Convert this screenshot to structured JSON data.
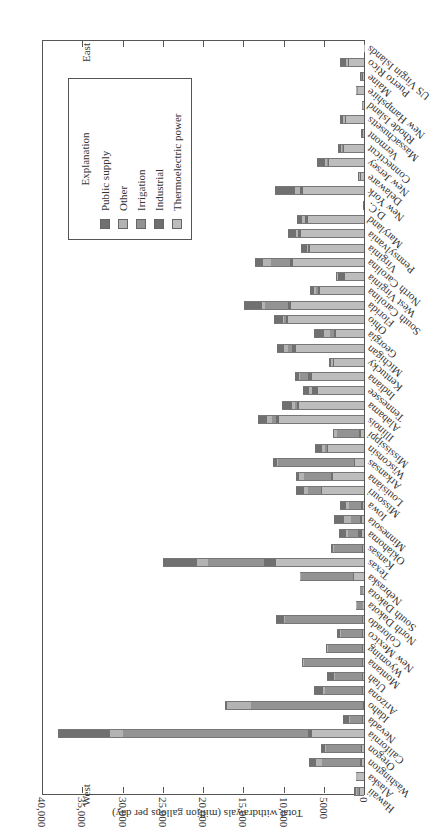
{
  "chart_data": {
    "type": "bar",
    "orientation": "rotated-90 (horizontal stacked bars extending left from axis; page rotated)",
    "stacked": true,
    "xlabel": "",
    "ylabel": "Total withdrawals (million gallons per day)",
    "ylim": [
      0,
      40000
    ],
    "yticks": [
      0,
      5000,
      10000,
      15000,
      20000,
      25000,
      30000,
      35000,
      40000
    ],
    "ytick_labels": [
      "0",
      "5000",
      "10,000",
      "15,000",
      "20,000",
      "25,000",
      "30,000",
      "35,000",
      "40,000"
    ],
    "grid": false,
    "annotations": {
      "west": "West",
      "east": "East"
    },
    "legend": {
      "title": "Explanation",
      "position": "upper-left inside plot (rotated)",
      "entries": [
        "Public supply",
        "Other",
        "Irrigation",
        "Industrial",
        "Thermoelectric power"
      ]
    },
    "series_colors": {
      "Thermoelectric power": "#bdbdbd",
      "Industrial": "#6f6f6f",
      "Irrigation": "#939393",
      "Other": "#b3b3b3",
      "Public supply": "#707070"
    },
    "stack_order": [
      "Thermoelectric power",
      "Industrial",
      "Irrigation",
      "Other",
      "Public supply"
    ],
    "categories": [
      "Hawaii",
      "Alaska",
      "Washington",
      "Oregon",
      "California",
      "Nevada",
      "Idaho",
      "Arizona",
      "Utah",
      "Montana",
      "Wyoming",
      "New Mexico",
      "Colorado",
      "North Dakota",
      "South Dakota",
      "Nebraska",
      "Texas",
      "Kansas",
      "Oklahoma",
      "Minnesota",
      "Iowa",
      "Missouri",
      "Louisiana",
      "Arkansas",
      "Wisconsin",
      "Mississippi",
      "Illinois",
      "Alabama",
      "Tennessee",
      "Indiana",
      "Kentucky",
      "Michigan",
      "Georgia",
      "Ohio",
      "Florida",
      "South Carolina",
      "West Virginia",
      "North Carolina",
      "Virginia",
      "Pennsylvania",
      "Maryland",
      "D.C.",
      "New York",
      "Delaware",
      "New Jersey",
      "Connecticut",
      "Vermont",
      "Massachusetts",
      "Rhode Island",
      "New Hampshire",
      "Maine",
      "Puerto Rico",
      "US Virgin Islands"
    ],
    "series": [
      {
        "name": "Thermoelectric power",
        "values": [
          500,
          700,
          200,
          300,
          6400,
          100,
          0,
          100,
          100,
          100,
          100,
          100,
          100,
          100,
          100,
          1300,
          10900,
          100,
          300,
          200,
          100,
          5200,
          3800,
          1100,
          4500,
          400,
          10600,
          8100,
          5700,
          6400,
          3700,
          8500,
          3500,
          9400,
          9100,
          5500,
          2400,
          8800,
          6700,
          7800,
          7000,
          0,
          7600,
          400,
          4300,
          2500,
          100,
          2200,
          100,
          700,
          100,
          1900,
          50
        ]
      },
      {
        "name": "Industrial",
        "values": [
          100,
          50,
          300,
          100,
          500,
          100,
          100,
          100,
          100,
          100,
          100,
          100,
          100,
          50,
          50,
          100,
          1500,
          100,
          500,
          300,
          300,
          200,
          300,
          100,
          100,
          200,
          300,
          200,
          700,
          500,
          100,
          400,
          200,
          300,
          300,
          200,
          800,
          400,
          200,
          400,
          300,
          0,
          300,
          50,
          200,
          100,
          100,
          100,
          50,
          100,
          200,
          100,
          0
        ]
      },
      {
        "name": "Irrigation",
        "values": [
          300,
          0,
          4700,
          4300,
          23100,
          1600,
          14000,
          4600,
          3400,
          7300,
          4300,
          2700,
          9600,
          700,
          300,
          6400,
          7000,
          3500,
          1200,
          1100,
          1500,
          1600,
          3300,
          9500,
          300,
          2800,
          500,
          300,
          100,
          1000,
          100,
          600,
          500,
          200,
          2900,
          300,
          0,
          2300,
          100,
          0,
          0,
          0,
          100,
          50,
          100,
          100,
          50,
          100,
          50,
          50,
          50,
          0,
          0
        ]
      },
      {
        "name": "Other",
        "values": [
          100,
          200,
          800,
          100,
          1500,
          100,
          2900,
          300,
          100,
          100,
          100,
          100,
          100,
          100,
          50,
          100,
          1300,
          200,
          300,
          900,
          300,
          500,
          700,
          100,
          300,
          300,
          600,
          300,
          300,
          200,
          200,
          500,
          800,
          200,
          400,
          200,
          100,
          1100,
          100,
          300,
          400,
          0,
          600,
          100,
          300,
          200,
          50,
          200,
          50,
          100,
          50,
          200,
          0
        ]
      },
      {
        "name": "Public supply",
        "values": [
          300,
          50,
          800,
          600,
          6500,
          700,
          300,
          1100,
          900,
          100,
          100,
          300,
          1000,
          100,
          50,
          100,
          4300,
          200,
          800,
          1200,
          800,
          1000,
          400,
          500,
          900,
          100,
          1200,
          1300,
          800,
          500,
          300,
          800,
          1200,
          1100,
          2200,
          500,
          200,
          900,
          700,
          900,
          600,
          100,
          2500,
          100,
          1000,
          300,
          50,
          400,
          50,
          100,
          50,
          800,
          0
        ]
      }
    ],
    "totals_approx": [
      1300,
      1000,
      6800,
      5400,
      38000,
      2600,
      17300,
      6200,
      4600,
      7700,
      4700,
      3300,
      10900,
      1050,
      550,
      8000,
      25000,
      4100,
      3100,
      3700,
      3000,
      8500,
      8500,
      11300,
      6100,
      3800,
      13200,
      10200,
      7600,
      8600,
      4400,
      10800,
      6200,
      11200,
      14900,
      6700,
      3500,
      13500,
      7800,
      9400,
      8300,
      100,
      11100,
      700,
      5900,
      3200,
      350,
      3000,
      300,
      1050,
      450,
      3000,
      50
    ]
  }
}
